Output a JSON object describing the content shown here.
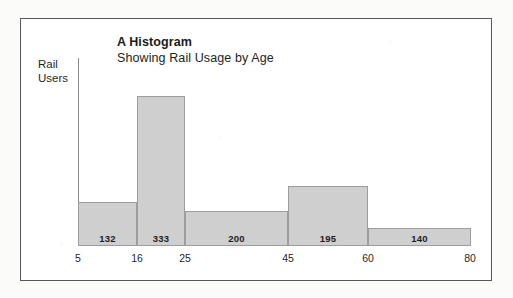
{
  "figure": {
    "frame_color": "#58585a",
    "background": "#ffffff"
  },
  "chart_data": {
    "type": "bar",
    "title": "A Histogram",
    "subtitle": "Showing Rail Usage by Age",
    "xlabel": "",
    "ylabel": "Rail Users",
    "ylabel_line1": "Rail",
    "ylabel_line2": "Users",
    "grid": false,
    "legend": false,
    "bin_edges": [
      5,
      16,
      25,
      45,
      60,
      80
    ],
    "tick_labels": [
      "5",
      "16",
      "25",
      "45",
      "60",
      "80"
    ],
    "categories": [
      "5-16",
      "16-25",
      "25-45",
      "45-60",
      "60-80"
    ],
    "values": [
      132,
      333,
      200,
      195,
      140
    ],
    "value_labels": [
      "132",
      "333",
      "200",
      "195",
      "140"
    ],
    "bar_fill": "#cfcfcf",
    "bar_stroke": "#9d9d9d",
    "axis_color": "#8d8d8d",
    "ylim": [
      0,
      333
    ],
    "note": "Histogram bar widths proportional to bin width; heights shown are frequency densities scaled so area reflects counts."
  },
  "bars": [
    {
      "label": "132",
      "left": 78,
      "width": 59,
      "top": 202,
      "height": 44
    },
    {
      "label": "333",
      "left": 137,
      "width": 48,
      "top": 96,
      "height": 150
    },
    {
      "label": "200",
      "left": 185,
      "width": 103,
      "top": 211,
      "height": 35
    },
    {
      "label": "195",
      "left": 288,
      "width": 80,
      "top": 186,
      "height": 60
    },
    {
      "label": "140",
      "left": 368,
      "width": 103,
      "top": 228,
      "height": 18
    }
  ],
  "ticks": [
    {
      "label": "5",
      "x": 78
    },
    {
      "label": "16",
      "x": 137
    },
    {
      "label": "25",
      "x": 185
    },
    {
      "label": "45",
      "x": 288
    },
    {
      "label": "60",
      "x": 368
    },
    {
      "label": "80",
      "x": 470
    }
  ]
}
